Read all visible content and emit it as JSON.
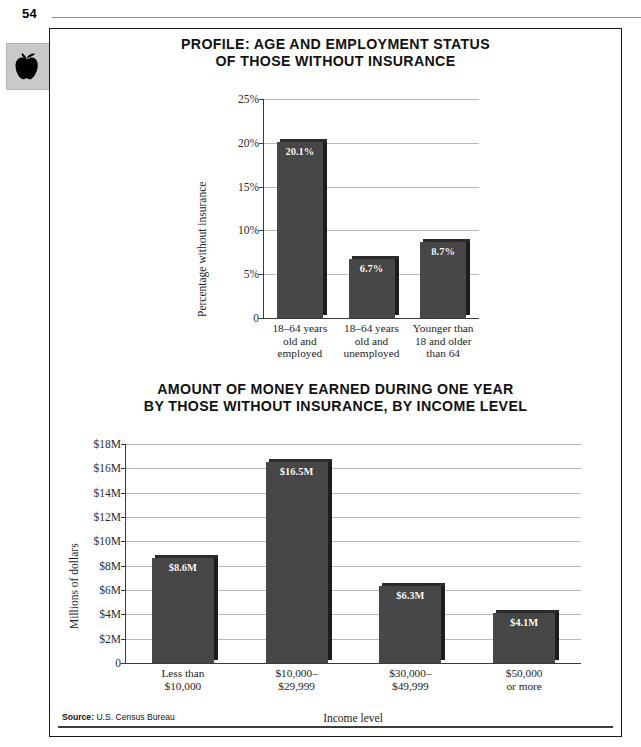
{
  "page": {
    "number": "54",
    "icon": "apple-icon",
    "source_prefix": "Source:",
    "source_text": "U.S. Census Bureau"
  },
  "chart_data": [
    {
      "id": "chart-age-employment",
      "type": "bar",
      "title": "PROFILE: AGE AND EMPLOYMENT STATUS\nOF THOSE WITHOUT INSURANCE",
      "title_line1": "PROFILE: AGE AND EMPLOYMENT STATUS",
      "title_line2": "OF THOSE WITHOUT INSURANCE",
      "categories": [
        "18–64 years\nold and\nemployed",
        "18–64 years\nold and\nunemployed",
        "Younger than\n18 and older\nthan 64"
      ],
      "values": [
        20.1,
        6.7,
        8.7
      ],
      "value_labels": [
        "20.1%",
        "6.7%",
        "8.7%"
      ],
      "xlabel": "",
      "ylabel": "Percentage without insurance",
      "ylim": [
        0,
        25
      ],
      "yticks": [
        0,
        5,
        10,
        15,
        20,
        25
      ],
      "ytick_labels": [
        "0",
        "5%",
        "10%",
        "15%",
        "20%",
        "25%"
      ],
      "grid": true,
      "legend": "none",
      "bar_color": "#474747"
    },
    {
      "id": "chart-income-level",
      "type": "bar",
      "title": "AMOUNT OF MONEY EARNED DURING ONE YEAR\nBY THOSE WITHOUT INSURANCE, BY INCOME LEVEL",
      "title_line1": "AMOUNT OF MONEY EARNED DURING ONE YEAR",
      "title_line2": "BY THOSE WITHOUT INSURANCE, BY INCOME LEVEL",
      "categories": [
        "Less than\n$10,000",
        "$10,000–\n$29,999",
        "$30,000–\n$49,999",
        "$50,000\nor more"
      ],
      "values": [
        8.6,
        16.5,
        6.3,
        4.1
      ],
      "value_labels": [
        "$8.6M",
        "$16.5M",
        "$6.3M",
        "$4.1M"
      ],
      "xlabel": "Income level",
      "ylabel": "Millions of dollars",
      "ylim": [
        0,
        18
      ],
      "yticks": [
        0,
        2,
        4,
        6,
        8,
        10,
        12,
        14,
        16,
        18
      ],
      "ytick_labels": [
        "0",
        "$2M",
        "$4M",
        "$6M",
        "$8M",
        "$10M",
        "$12M",
        "$14M",
        "$16M",
        "$18M"
      ],
      "grid": true,
      "legend": "none",
      "bar_color": "#474747"
    }
  ]
}
